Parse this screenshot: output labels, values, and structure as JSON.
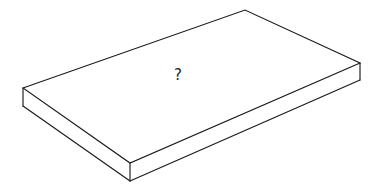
{
  "figure": {
    "title": "",
    "kind": "isometric-rectangular-slab",
    "background_color": "#ffffff",
    "line_color": "#1a1a1a",
    "face_fill_color": "#ffffff",
    "line_width_px": 1.15,
    "annotation": {
      "text": "?",
      "name": "question-mark",
      "color": "#1a1a1a",
      "font_size_px": 15,
      "position_px": {
        "x": 179,
        "y": 76
      }
    },
    "geometry": {
      "units": "pixels",
      "canvas": {
        "width": 378,
        "height": 191
      },
      "thickness_px": 18,
      "top_face_vertices": [
        {
          "name": "left",
          "x": 23,
          "y": 88
        },
        {
          "name": "back",
          "x": 245,
          "y": 10
        },
        {
          "name": "right",
          "x": 360,
          "y": 63
        },
        {
          "name": "front",
          "x": 130,
          "y": 163
        }
      ],
      "bottom_face_vertices": [
        {
          "name": "left-bottom",
          "x": 23,
          "y": 106
        },
        {
          "name": "front-bottom",
          "x": 130,
          "y": 181
        },
        {
          "name": "right-bottom",
          "x": 360,
          "y": 80
        }
      ],
      "visible_faces": [
        "top",
        "left-side",
        "right-side"
      ],
      "paths": {
        "top_face": "M 23 88 L 245 10 L 360 63 L 130 163 Z",
        "left_face": "M 23 88 L 23 106 L 130 181 L 130 163 Z",
        "right_face": "M 130 163 L 130 181 L 360 80 L 360 63 Z",
        "left_vertical_edge": "M 23 88 L 23 106",
        "front_vertical_edge": "M 130 163 L 130 181",
        "right_vertical_edge": "M 360 63 L 360 80",
        "bottom_left_edge": "M 23 106 L 130 181",
        "bottom_right_edge": "M 130 181 L 360 80"
      }
    }
  },
  "chart_data": {
    "type": "diagram",
    "title": "",
    "labels": [
      "?"
    ]
  }
}
